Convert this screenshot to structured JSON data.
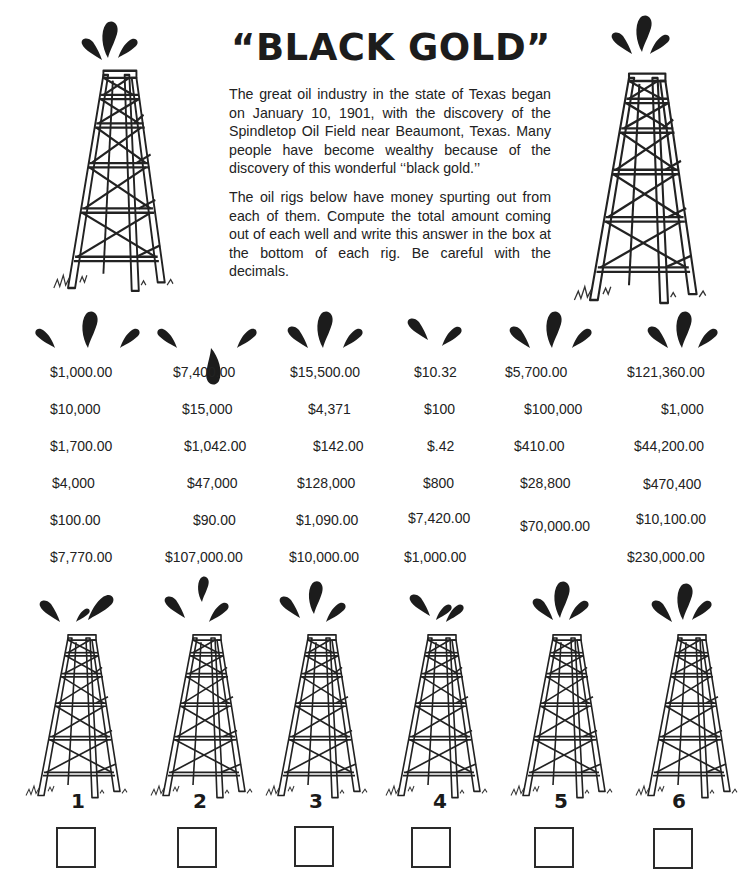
{
  "title": "“BLACK GOLD”",
  "intro": {
    "paragraph1": "The great oil industry in the state of Texas began on January 10, 1901, with the discovery of the Spindletop Oil Field near Beaumont, Texas. Many people have become wealthy because of the discovery of this wonderful ‘‘black gold.’’",
    "paragraph2": "The oil rigs below have money spurting out from each of them. Compute the total amount coming out of each well and write this answer in the box at the bottom of each rig. Be careful with the decimals."
  },
  "rigs": [
    {
      "number": "1",
      "amounts": [
        "$1,000.00",
        "$10,000",
        "$1,700.00",
        "$4,000",
        "$100.00",
        "$7,770.00"
      ],
      "answer": ""
    },
    {
      "number": "2",
      "amounts": [
        "$7,400.00",
        "$15,000",
        "$1,042.00",
        "$47,000",
        "$90.00",
        "$107,000.00"
      ],
      "answer": ""
    },
    {
      "number": "3",
      "amounts": [
        "$15,500.00",
        "$4,371",
        "$142.00",
        "$128,000",
        "$1,090.00",
        "$10,000.00"
      ],
      "answer": ""
    },
    {
      "number": "4",
      "amounts": [
        "$10.32",
        "$100",
        "$.42",
        "$800",
        "$7,420.00",
        "$1,000.00"
      ],
      "answer": ""
    },
    {
      "number": "5",
      "amounts": [
        "$5,700.00",
        "$100,000",
        "$410.00",
        "$28,800",
        "$70,000.00"
      ],
      "answer": ""
    },
    {
      "number": "6",
      "amounts": [
        "$121,360.00",
        "$1,000",
        "$44,200.00",
        "$470,400",
        "$10,100.00",
        "$230,000.00"
      ],
      "answer": ""
    }
  ],
  "icons": {
    "oil_rig": "oil-derrick-drawing",
    "gusher": "oil-droplet-splash"
  },
  "colors": {
    "ink": "#1c1c1c",
    "background": "#ffffff"
  }
}
